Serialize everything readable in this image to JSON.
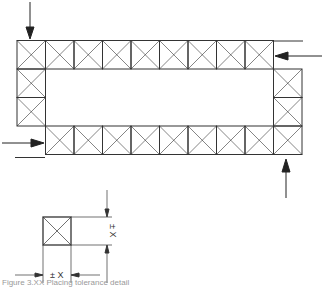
{
  "diagram": {
    "ring": {
      "top_row_cells": 9,
      "bottom_row_cells": 9,
      "left_column_cells": 2,
      "right_column_cells": 2,
      "cell_size_px": 28.5,
      "line_color": "#333333"
    },
    "arrows": [
      {
        "name": "top-left-down",
        "direction": "down"
      },
      {
        "name": "right-top-left",
        "direction": "left"
      },
      {
        "name": "left-bottom-right",
        "direction": "right"
      },
      {
        "name": "bottom-right-up",
        "direction": "up"
      }
    ],
    "detail": {
      "horizontal_label": "± X",
      "vertical_label": "± X"
    },
    "caption": "Figure 3.XX Placing tolerance detail"
  }
}
